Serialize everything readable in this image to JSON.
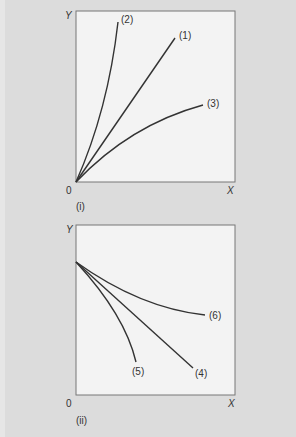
{
  "colors": {
    "background": "#dcdcdc",
    "plot_area": "#f3f3f3",
    "frame": "#777777",
    "line": "#333333"
  },
  "panels": [
    {
      "id": "i",
      "caption": "(i)",
      "origin_label": "0",
      "x_axis_label": "X",
      "y_axis_label": "Y",
      "curves": [
        {
          "label": "(1)",
          "shape": "straight line through origin, increasing"
        },
        {
          "label": "(2)",
          "shape": "convex curve through origin, increasing steeply"
        },
        {
          "label": "(3)",
          "shape": "concave curve through origin, increasing gradually"
        }
      ]
    },
    {
      "id": "ii",
      "caption": "(ii)",
      "origin_label": "0",
      "x_axis_label": "X",
      "y_axis_label": "Y",
      "curves": [
        {
          "label": "(4)",
          "shape": "straight line from Y-intercept, decreasing"
        },
        {
          "label": "(5)",
          "shape": "concave curve from Y-intercept, decreasing steeply"
        },
        {
          "label": "(6)",
          "shape": "convex curve from Y-intercept, decreasing gradually"
        }
      ]
    }
  ]
}
